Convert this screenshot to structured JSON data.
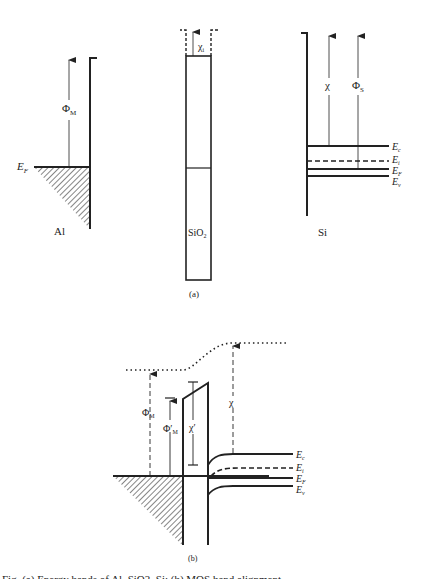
{
  "figure": {
    "part_a": {
      "caption": "(a)",
      "metal": {
        "label": "Al",
        "fermi_label": "E",
        "fermi_sub": "F",
        "work_function": "Φ",
        "work_function_sub": "M"
      },
      "oxide": {
        "label": "SiO",
        "label_sub": "2",
        "affinity": "χ",
        "affinity_sub": "i"
      },
      "semiconductor": {
        "label": "Si",
        "affinity": "χ",
        "work_function": "Φ",
        "work_function_sub": "S",
        "levels": [
          {
            "name": "E",
            "sub": "c"
          },
          {
            "name": "E",
            "sub": "i"
          },
          {
            "name": "E",
            "sub": "F"
          },
          {
            "name": "E",
            "sub": "v"
          }
        ]
      }
    },
    "part_b": {
      "caption": "(b)",
      "metal_work_function": "Φ",
      "metal_work_function_sub": "M",
      "effective_work_function": "Φ′",
      "effective_work_function_sub": "M",
      "oxide_affinity": "χ′",
      "si_affinity": "χ",
      "levels": [
        {
          "name": "E",
          "sub": "c"
        },
        {
          "name": "E",
          "sub": "i"
        },
        {
          "name": "E",
          "sub": "F"
        },
        {
          "name": "E",
          "sub": "v"
        }
      ]
    },
    "caption_text": "Fig. (a) Energy bands of Al, SiO2, Si; (b) MOS band alignment"
  }
}
